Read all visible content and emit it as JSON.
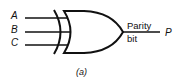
{
  "diagram": {
    "gate_type": "XOR",
    "inputs": [
      {
        "label": "A"
      },
      {
        "label": "B"
      },
      {
        "label": "C"
      }
    ],
    "output": {
      "name_line1": "Parity",
      "name_line2": "bit",
      "label": "P"
    },
    "caption": "(a)",
    "stroke_color": "#111111"
  }
}
